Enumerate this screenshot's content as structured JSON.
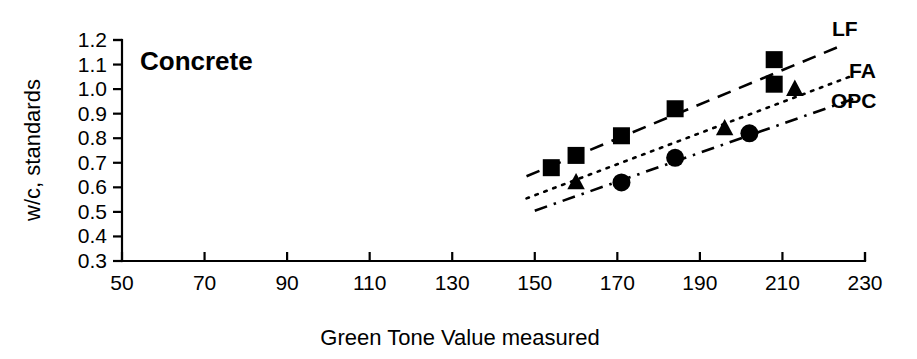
{
  "chart_data": {
    "type": "scatter",
    "title": "Concrete",
    "xlabel": "Green Tone Value measured",
    "ylabel": "w/c, standards",
    "xlim": [
      50,
      230
    ],
    "ylim": [
      0.3,
      1.2
    ],
    "xticks": [
      "50",
      "70",
      "90",
      "110",
      "130",
      "150",
      "170",
      "190",
      "210",
      "230"
    ],
    "xtick_values": [
      50,
      70,
      90,
      110,
      130,
      150,
      170,
      190,
      210,
      230
    ],
    "yticks": [
      "1.2",
      "1.1",
      "1.0",
      "0.9",
      "0.8",
      "0.7",
      "0.6",
      "0.5",
      "0.4",
      "0.3"
    ],
    "ytick_values": [
      1.2,
      1.1,
      1.0,
      0.9,
      0.8,
      0.7,
      0.6,
      0.5,
      0.4,
      0.3
    ],
    "grid": false,
    "legend_position": "right-inline",
    "series": [
      {
        "name": "LF",
        "marker": "filled-square",
        "line_style": "dashed",
        "points": [
          {
            "x": 154,
            "y": 0.68
          },
          {
            "x": 160,
            "y": 0.73
          },
          {
            "x": 171,
            "y": 0.81
          },
          {
            "x": 184,
            "y": 0.92
          },
          {
            "x": 208,
            "y": 1.12
          },
          {
            "x": 208,
            "y": 1.02
          }
        ],
        "trend": {
          "x1": 148,
          "y1": 0.645,
          "x2": 224,
          "y2": 1.175
        }
      },
      {
        "name": "FA",
        "marker": "open-triangle",
        "line_style": "dotted",
        "points": [
          {
            "x": 160,
            "y": 0.62
          },
          {
            "x": 196,
            "y": 0.84
          },
          {
            "x": 213,
            "y": 1.0
          }
        ],
        "trend": {
          "x1": 148,
          "y1": 0.555,
          "x2": 227,
          "y2": 1.055
        }
      },
      {
        "name": "OPC",
        "marker": "filled-circle",
        "line_style": "dash-dot",
        "points": [
          {
            "x": 171,
            "y": 0.62
          },
          {
            "x": 184,
            "y": 0.72
          },
          {
            "x": 202,
            "y": 0.82
          }
        ],
        "trend": {
          "x1": 150,
          "y1": 0.505,
          "x2": 228,
          "y2": 0.965
        }
      }
    ],
    "legend_entries": [
      {
        "label": "LF",
        "px": 832,
        "py": 36
      },
      {
        "label": "FA",
        "px": 849,
        "py": 78
      },
      {
        "label": "OPC",
        "px": 831,
        "py": 108
      }
    ]
  }
}
